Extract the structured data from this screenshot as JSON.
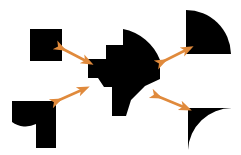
{
  "image": {
    "width": 241,
    "height": 155,
    "background_color": "#ffffff",
    "title": "Shape decomposition diagram",
    "description": "A central black composite shape surrounded by four black shape pieces, each linked to the center by an orange double-headed arrow."
  },
  "colors": {
    "shape_fill": "#000000",
    "arrow": "#E08A3C",
    "arrow_light": "#EFAE72",
    "background": "#ffffff"
  },
  "shapes": [
    {
      "id": "top-left-square",
      "name": "square-piece",
      "label": "Square",
      "corner": "top-left",
      "fill": "#000000",
      "geometry": "M 30 29 L 62 29 L 62 61 L 30 61 Z"
    },
    {
      "id": "top-right-quarter-disc",
      "name": "quarter-disc-piece",
      "label": "Quarter disc",
      "corner": "top-right",
      "fill": "#000000",
      "geometry": "M 186 10 L 186 54 L 231 54 A 45 45 0 0 0 186 10 Z"
    },
    {
      "id": "bottom-left-notched-piece",
      "name": "notched-piece",
      "label": "Notched piece",
      "corner": "bottom-left",
      "fill": "#000000",
      "geometry": "M 12 101 L 56 101 L 56 148 L 36 148 L 36 124 A 23 23 0 0 1 12 122 Z"
    },
    {
      "id": "bottom-right-concave-corner",
      "name": "concave-corner-piece",
      "label": "Concave corner",
      "corner": "bottom-right",
      "fill": "#000000",
      "geometry": "M 188 108 L 232 108 A 44 44 0 0 0 188 150 Z"
    },
    {
      "id": "center-composite",
      "name": "composite-shape",
      "label": "Composite shape",
      "corner": "center",
      "fill": "#000000",
      "geometry": "M 123 29 L 123 45 L 106 45 L 106 59 L 88 59 L 88 78 L 98 78 L 104 87 L 112 87 L 112 116 L 126 116 L 131 100 L 145 86 L 160 79 L 160 60 A 50 50 0 0 0 123 29 Z"
    }
  ],
  "arrows": [
    {
      "id": "arrow-top-left",
      "name": "arrow-top-left",
      "label": "Top-left correspondence arrow",
      "double_headed": true,
      "from": [
        61,
        48
      ],
      "to": [
        88,
        62
      ],
      "color": "#E08A3C"
    },
    {
      "id": "arrow-top-right",
      "name": "arrow-top-right",
      "label": "Top-right correspondence arrow",
      "double_headed": true,
      "from": [
        162,
        62
      ],
      "to": [
        188,
        49
      ],
      "color": "#E08A3C"
    },
    {
      "id": "arrow-bottom-left",
      "name": "arrow-bottom-left",
      "label": "Bottom-left correspondence arrow",
      "double_headed": true,
      "from": [
        57,
        101
      ],
      "to": [
        84,
        89
      ],
      "color": "#E08A3C"
    },
    {
      "id": "arrow-bottom-right",
      "name": "arrow-bottom-right",
      "label": "Bottom-right correspondence arrow",
      "double_headed": true,
      "from": [
        157,
        96
      ],
      "to": [
        186,
        108
      ],
      "color": "#E08A3C"
    }
  ]
}
